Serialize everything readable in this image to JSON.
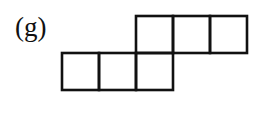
{
  "figure": {
    "label": "(g)",
    "stroke_color": "#111111",
    "stroke_width": 2.6,
    "squares": [
      {
        "row": 0,
        "col": 2
      },
      {
        "row": 0,
        "col": 3
      },
      {
        "row": 0,
        "col": 4
      },
      {
        "row": 1,
        "col": 0
      },
      {
        "row": 1,
        "col": 1
      },
      {
        "row": 1,
        "col": 2
      }
    ],
    "cell_size": 37,
    "origin_x": 62,
    "origin_y": 16
  }
}
